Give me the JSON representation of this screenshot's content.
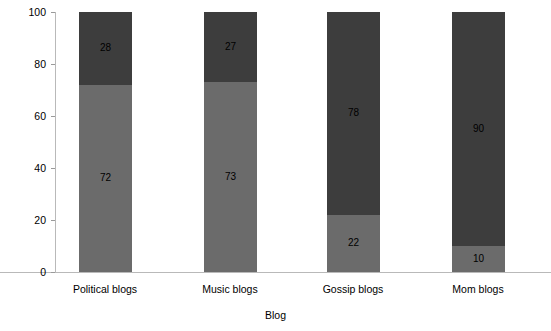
{
  "chart_data": {
    "type": "bar",
    "subtype": "stacked-bar-100",
    "title": "",
    "xlabel": "Blog",
    "ylabel": "Percentage",
    "categories": [
      "Political blogs",
      "Music blogs",
      "Gossip blogs",
      "Mom blogs"
    ],
    "series": [
      {
        "name": "lower-segment",
        "color": "#6b6b6b",
        "values": [
          72,
          73,
          22,
          10
        ]
      },
      {
        "name": "upper-segment",
        "color": "#3d3d3d",
        "values": [
          28,
          27,
          78,
          90
        ]
      }
    ],
    "ylim": [
      0,
      100
    ],
    "yticks": [
      0,
      20,
      40,
      60,
      80,
      100
    ],
    "ytick_labels": [
      "0",
      "20",
      "40",
      "60",
      "80",
      "100"
    ],
    "grid": false,
    "legend": "none",
    "data_labels": [
      {
        "category": "Political blogs",
        "lower": "72",
        "upper": "28"
      },
      {
        "category": "Music blogs",
        "lower": "73",
        "upper": "27"
      },
      {
        "category": "Gossip blogs",
        "lower": "22",
        "upper": "78"
      },
      {
        "category": "Mom blogs",
        "lower": "10",
        "upper": "90"
      }
    ]
  },
  "axes": {
    "y_title": "Percentage",
    "x_title": "Blog",
    "y_ticks": [
      {
        "label": "100",
        "value": 100
      },
      {
        "label": "80",
        "value": 80
      },
      {
        "label": "60",
        "value": 60
      },
      {
        "label": "40",
        "value": 40
      },
      {
        "label": "20",
        "value": 20
      },
      {
        "label": "0",
        "value": 0
      }
    ],
    "x_ticks": [
      {
        "label": "Political blogs"
      },
      {
        "label": "Music blogs"
      },
      {
        "label": "Gossip blogs"
      },
      {
        "label": "Mom blogs"
      }
    ]
  },
  "colors": {
    "lower_segment": "#6b6b6b",
    "upper_segment": "#3d3d3d",
    "axis_line": "#b9b9b9",
    "tick_mark": "#9a9a9a",
    "text": "#000000",
    "background": "#ffffff"
  }
}
